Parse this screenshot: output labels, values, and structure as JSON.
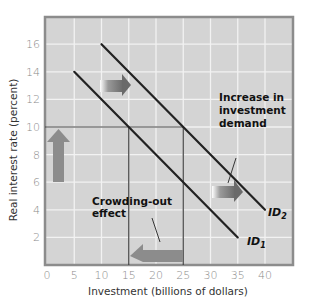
{
  "chart_data": {
    "type": "line",
    "title": "",
    "xlabel": "Investment (billions of dollars)",
    "ylabel": "Real interest rate (percent)",
    "xlim": [
      0,
      45
    ],
    "ylim": [
      0,
      18
    ],
    "x_ticks": [
      "0",
      "5",
      "10",
      "15",
      "20",
      "25",
      "30",
      "35",
      "40"
    ],
    "y_ticks": [
      "2",
      "4",
      "6",
      "8",
      "10",
      "12",
      "14",
      "16"
    ],
    "grid": true,
    "series": [
      {
        "name": "ID1",
        "label_main": "ID",
        "label_sub": "1",
        "points": [
          [
            5,
            14
          ],
          [
            35,
            2
          ]
        ]
      },
      {
        "name": "ID2",
        "label_main": "ID",
        "label_sub": "2",
        "points": [
          [
            10,
            16
          ],
          [
            40,
            4
          ]
        ]
      }
    ],
    "reference_lines": {
      "horizontal_rate": 10,
      "vertical_investment": [
        15,
        25
      ]
    },
    "annotations": {
      "increase_line1": "Increase in",
      "increase_line2": "investment",
      "increase_line3": "demand",
      "crowding_line1": "Crowding-out",
      "crowding_line2": "effect"
    },
    "arrows": [
      {
        "name": "shift-right-upper",
        "direction": "right",
        "at": [
          15,
          13
        ]
      },
      {
        "name": "shift-right-lower",
        "direction": "right",
        "at": [
          33,
          5
        ]
      },
      {
        "name": "interest-rate-rise",
        "direction": "up",
        "at": [
          2,
          7
        ]
      },
      {
        "name": "crowding-out-left",
        "direction": "left",
        "at": [
          20,
          1
        ]
      }
    ]
  },
  "colors": {
    "plot_bg": "#d4d4d4",
    "grid": "#f2f2f2",
    "frame": "#8c8c8c",
    "line": "#222222",
    "arrow": "#888888"
  }
}
